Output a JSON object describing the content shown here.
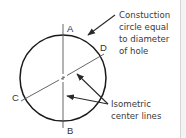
{
  "diagram": {
    "points": {
      "A": "A",
      "B": "B",
      "C": "C",
      "D": "D"
    },
    "callouts": {
      "construction": [
        "Constuction",
        "circle equal",
        "to diameter",
        "of hole"
      ],
      "centerlines": [
        "Isometric",
        "center lines"
      ]
    },
    "colors": {
      "stroke": "#1a1a1a",
      "text": "#333333"
    }
  }
}
